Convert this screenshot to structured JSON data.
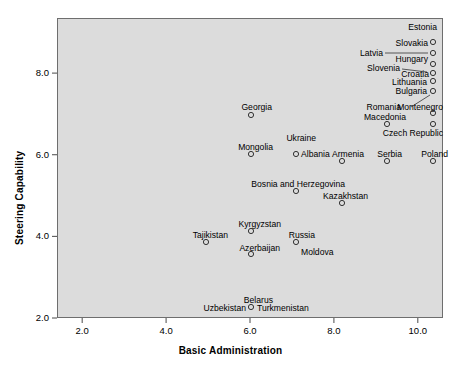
{
  "chart_data": {
    "type": "scatter",
    "title": "",
    "xlabel": "Basic Administration",
    "ylabel": "Steering Capability",
    "xlim": [
      1.4,
      10.6
    ],
    "ylim": [
      2.0,
      9.35
    ],
    "xticks": [
      "2.0",
      "4.0",
      "6.0",
      "8.0",
      "10.0"
    ],
    "xtick_values": [
      2.0,
      4.0,
      6.0,
      8.0,
      10.0
    ],
    "yticks": [
      "2.0",
      "4.0",
      "6.0",
      "8.0"
    ],
    "ytick_values": [
      2.0,
      4.0,
      6.0,
      8.0
    ],
    "grid": false,
    "legend": null,
    "marker": "open-circle",
    "plot_background": "#dcdcdc",
    "frame_color": "#6e6e6e",
    "marker_color": "#333333",
    "points": [
      {
        "label": "Estonia",
        "x": 10.0,
        "y": 8.95,
        "label_pos": "above-left"
      },
      {
        "label": "Slovakia",
        "x": 10.0,
        "y": 8.65,
        "label_pos": "left"
      },
      {
        "label": "Latvia",
        "x": 10.0,
        "y": 8.65,
        "label_pos": "far-left-leader"
      },
      {
        "label": "Hungary",
        "x": 10.0,
        "y": 8.35,
        "label_pos": "below-left"
      },
      {
        "label": "Slovenia",
        "x": 10.0,
        "y": 8.22,
        "label_pos": "far-left-leader"
      },
      {
        "label": "Croatia",
        "x": 10.0,
        "y": 8.22,
        "label_pos": "left"
      },
      {
        "label": "Lithuania",
        "x": 10.0,
        "y": 8.0,
        "label_pos": "left"
      },
      {
        "label": "Bulgaria",
        "x": 10.0,
        "y": 7.72,
        "label_pos": "left"
      },
      {
        "label": "Montenegro",
        "x": 10.0,
        "y": 7.4,
        "label_pos": "above-left-leader"
      },
      {
        "label": "Romania",
        "x": 9.0,
        "y": 7.15,
        "label_pos": "above-left"
      },
      {
        "label": "Macedonia",
        "x": 9.0,
        "y": 7.15,
        "label_pos": "above"
      },
      {
        "label": "Czech Republic",
        "x": 10.0,
        "y": 7.15,
        "label_pos": "below-left"
      },
      {
        "label": "Georgia",
        "x": 6.0,
        "y": 7.35,
        "label_pos": "above"
      },
      {
        "label": "Ukraine",
        "x": 7.0,
        "y": 6.35,
        "label_pos": "above"
      },
      {
        "label": "Mongolia",
        "x": 6.0,
        "y": 6.3,
        "label_pos": "above"
      },
      {
        "label": "Albania",
        "x": 7.0,
        "y": 6.3,
        "label_pos": "right"
      },
      {
        "label": "Armenia",
        "x": 8.0,
        "y": 6.05,
        "label_pos": "above"
      },
      {
        "label": "Serbia",
        "x": 9.0,
        "y": 6.05,
        "label_pos": "above"
      },
      {
        "label": "Poland",
        "x": 10.0,
        "y": 6.05,
        "label_pos": "above"
      },
      {
        "label": "Bosnia and Herzegovina",
        "x": 7.0,
        "y": 5.35,
        "label_pos": "above"
      },
      {
        "label": "Kazakhstan",
        "x": 8.0,
        "y": 5.05,
        "label_pos": "above"
      },
      {
        "label": "Kyrgyzstan",
        "x": 6.0,
        "y": 4.3,
        "label_pos": "above"
      },
      {
        "label": "Tajikistan",
        "x": 5.0,
        "y": 4.05,
        "label_pos": "above"
      },
      {
        "label": "Russia",
        "x": 7.0,
        "y": 4.05,
        "label_pos": "above"
      },
      {
        "label": "Azerbaijan",
        "x": 6.0,
        "y": 3.75,
        "label_pos": "above"
      },
      {
        "label": "Moldova",
        "x": 7.0,
        "y": 4.05,
        "label_pos": "below-right"
      },
      {
        "label": "Belarus",
        "x": 6.0,
        "y": 2.3,
        "label_pos": "above"
      },
      {
        "label": "Uzbekistan",
        "x": 6.0,
        "y": 2.3,
        "label_pos": "left"
      },
      {
        "label": "Turkmenistan",
        "x": 6.0,
        "y": 2.3,
        "label_pos": "right"
      }
    ],
    "markers": [
      {
        "name": "estonia",
        "x": 433,
        "y": 42
      },
      {
        "name": "slovakia-latvia",
        "x": 433,
        "y": 53
      },
      {
        "name": "hungary",
        "x": 433,
        "y": 64
      },
      {
        "name": "slovenia-croatia",
        "x": 433,
        "y": 73
      },
      {
        "name": "lithuania",
        "x": 433,
        "y": 81
      },
      {
        "name": "bulgaria",
        "x": 433,
        "y": 91
      },
      {
        "name": "montenegro",
        "x": 433,
        "y": 113
      },
      {
        "name": "romania-macedonia",
        "x": 387,
        "y": 124
      },
      {
        "name": "czech-republic",
        "x": 433,
        "y": 124
      },
      {
        "name": "georgia",
        "x": 251,
        "y": 115
      },
      {
        "name": "mongolia",
        "x": 251,
        "y": 154
      },
      {
        "name": "ukraine-albania",
        "x": 296,
        "y": 154
      },
      {
        "name": "armenia",
        "x": 342,
        "y": 161
      },
      {
        "name": "serbia",
        "x": 387,
        "y": 161
      },
      {
        "name": "poland",
        "x": 433,
        "y": 161
      },
      {
        "name": "bosnia-and-herzegovina",
        "x": 296,
        "y": 191
      },
      {
        "name": "kazakhstan",
        "x": 342,
        "y": 203
      },
      {
        "name": "kyrgyzstan",
        "x": 251,
        "y": 231
      },
      {
        "name": "tajikistan",
        "x": 206,
        "y": 242
      },
      {
        "name": "russia-moldova",
        "x": 296,
        "y": 242
      },
      {
        "name": "azerbaijan",
        "x": 251,
        "y": 254
      },
      {
        "name": "belarus-uzbekistan-turkmenistan",
        "x": 251,
        "y": 307
      }
    ],
    "labels": [
      {
        "name": "estonia",
        "text": "Estonia",
        "x": 437,
        "y": 30,
        "anchor": "end"
      },
      {
        "name": "slovakia",
        "text": "Slovakia",
        "x": 428,
        "y": 46,
        "anchor": "end"
      },
      {
        "name": "latvia",
        "text": "Latvia",
        "x": 383,
        "y": 56,
        "anchor": "end"
      },
      {
        "name": "hungary",
        "text": "Hungary",
        "x": 428,
        "y": 62,
        "anchor": "end"
      },
      {
        "name": "slovenia",
        "text": "Slovenia",
        "x": 400,
        "y": 71,
        "anchor": "end"
      },
      {
        "name": "croatia",
        "text": "Croatia",
        "x": 429,
        "y": 77,
        "anchor": "end"
      },
      {
        "name": "lithuania",
        "text": "Lithuania",
        "x": 427,
        "y": 85,
        "anchor": "end"
      },
      {
        "name": "bulgaria",
        "text": "Bulgaria",
        "x": 427,
        "y": 94,
        "anchor": "end"
      },
      {
        "name": "montenegro",
        "text": "Montenegro",
        "x": 443,
        "y": 110,
        "anchor": "end"
      },
      {
        "name": "romania",
        "text": "Romania",
        "x": 401,
        "y": 110,
        "anchor": "end"
      },
      {
        "name": "macedonia",
        "text": "Macedonia",
        "x": 406,
        "y": 120,
        "anchor": "end"
      },
      {
        "name": "czech-republic",
        "text": "Czech Republic",
        "x": 443,
        "y": 136,
        "anchor": "end"
      },
      {
        "name": "georgia",
        "text": "Georgia",
        "x": 272,
        "y": 110,
        "anchor": "end"
      },
      {
        "name": "ukraine",
        "text": "Ukraine",
        "x": 316,
        "y": 141,
        "anchor": "end"
      },
      {
        "name": "mongolia",
        "text": "Mongolia",
        "x": 273,
        "y": 150,
        "anchor": "end"
      },
      {
        "name": "albania",
        "text": "Albania",
        "x": 301,
        "y": 157,
        "anchor": "start"
      },
      {
        "name": "armenia",
        "text": "Armenia",
        "x": 364,
        "y": 157,
        "anchor": "end"
      },
      {
        "name": "serbia",
        "text": "Serbia",
        "x": 402,
        "y": 157,
        "anchor": "end"
      },
      {
        "name": "poland",
        "text": "Poland",
        "x": 448,
        "y": 157,
        "anchor": "end"
      },
      {
        "name": "bosnia-and-herzegovina",
        "text": "Bosnia and Herzegovina",
        "x": 345,
        "y": 187,
        "anchor": "end"
      },
      {
        "name": "kazakhstan",
        "text": "Kazakhstan",
        "x": 368,
        "y": 199,
        "anchor": "end"
      },
      {
        "name": "kyrgyzstan",
        "text": "Kyrgyzstan",
        "x": 281,
        "y": 227,
        "anchor": "end"
      },
      {
        "name": "tajikistan",
        "text": "Tajikistan",
        "x": 228,
        "y": 238,
        "anchor": "end"
      },
      {
        "name": "russia",
        "text": "Russia",
        "x": 315,
        "y": 238,
        "anchor": "end"
      },
      {
        "name": "azerbaijan",
        "text": "Azerbaijan",
        "x": 280,
        "y": 251,
        "anchor": "end"
      },
      {
        "name": "moldova",
        "text": "Moldova",
        "x": 301,
        "y": 255,
        "anchor": "start"
      },
      {
        "name": "belarus",
        "text": "Belarus",
        "x": 273,
        "y": 303,
        "anchor": "end"
      },
      {
        "name": "uzbekistan",
        "text": "Uzbekistan",
        "x": 246,
        "y": 311,
        "anchor": "end"
      },
      {
        "name": "turkmenistan",
        "text": "Turkmenistan",
        "x": 257,
        "y": 311,
        "anchor": "start"
      }
    ],
    "leader_lines": [
      {
        "name": "latvia-leader",
        "x1": 385,
        "y1": 53,
        "x2": 428,
        "y2": 53
      },
      {
        "name": "slovenia-leader",
        "x1": 402,
        "y1": 69,
        "x2": 427,
        "y2": 72
      },
      {
        "name": "montenegro-leader",
        "x1": 411,
        "y1": 107,
        "x2": 430,
        "y2": 95
      }
    ]
  }
}
